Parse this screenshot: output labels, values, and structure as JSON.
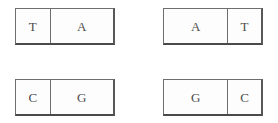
{
  "diagram": {
    "kind": "base-pair-boxes",
    "colors": {
      "border": "#6e6e6e",
      "shadow_border": "#4a4a4a",
      "text": "#4c4c4c",
      "fill": "#fdfdfd",
      "background": "#ffffff"
    },
    "boxes": [
      {
        "id": "top-left",
        "left_cell": {
          "label": "T",
          "width": "narrow"
        },
        "right_cell": {
          "label": "A",
          "width": "wide"
        }
      },
      {
        "id": "top-right",
        "left_cell": {
          "label": "A",
          "width": "wide"
        },
        "right_cell": {
          "label": "T",
          "width": "narrow"
        }
      },
      {
        "id": "bottom-left",
        "left_cell": {
          "label": "C",
          "width": "narrow"
        },
        "right_cell": {
          "label": "G",
          "width": "wide"
        }
      },
      {
        "id": "bottom-right",
        "left_cell": {
          "label": "G",
          "width": "wide"
        },
        "right_cell": {
          "label": "C",
          "width": "narrow"
        }
      }
    ]
  }
}
